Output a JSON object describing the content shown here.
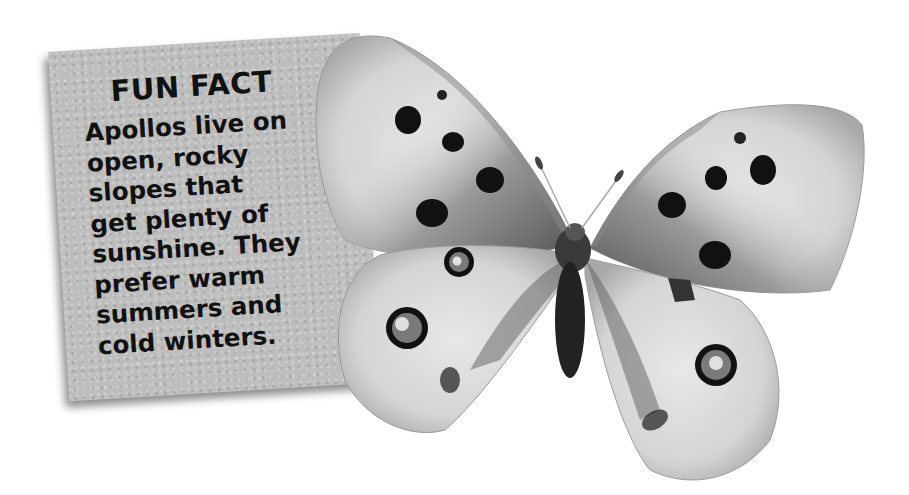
{
  "fun_fact_card": {
    "title": "FUN FACT",
    "body": "Apollos live on\nopen, rocky\nslopes that\nget plenty of\nsunshine. They\nprefer warm\nsummers and\ncold winters."
  },
  "image": {
    "subject": "Apollo butterfly",
    "color_mode": "grayscale"
  },
  "colors": {
    "card_background": "#bdbdbd",
    "text": "#111111",
    "page_background": "#ffffff"
  }
}
